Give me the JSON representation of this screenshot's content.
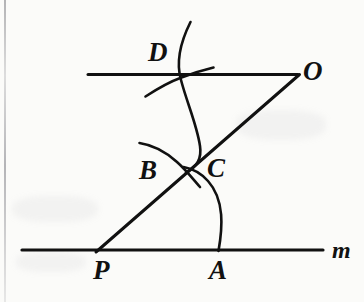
{
  "figure": {
    "type": "geometry-construction-diagram",
    "stroke_color": "#111111",
    "background_color": "#fbfbf9",
    "labels": {
      "D": "D",
      "O": "O",
      "B": "B",
      "C": "C",
      "P": "P",
      "A": "A",
      "m": "m"
    },
    "points": {
      "P": {
        "x": 98,
        "y": 250
      },
      "A": {
        "x": 218,
        "y": 250
      },
      "B": {
        "x": 185,
        "y": 172
      },
      "C": {
        "x": 185,
        "y": 172
      },
      "D": {
        "x": 181,
        "y": 75
      },
      "O": {
        "x": 298,
        "y": 75
      }
    },
    "label_positions": {
      "D": {
        "x": 148,
        "y": 39
      },
      "O": {
        "x": 303,
        "y": 58
      },
      "B": {
        "x": 139,
        "y": 157
      },
      "C": {
        "x": 207,
        "y": 155
      },
      "P": {
        "x": 93,
        "y": 257
      },
      "A": {
        "x": 209,
        "y": 257
      },
      "m": {
        "x": 332,
        "y": 238
      }
    },
    "segments": [
      {
        "name": "line-m",
        "x1": 22,
        "y1": 250,
        "x2": 323,
        "y2": 250
      },
      {
        "name": "line-through-O",
        "x1": 88,
        "y1": 74,
        "x2": 298,
        "y2": 74
      },
      {
        "name": "transversal-PO",
        "x1": 96,
        "y1": 252,
        "x2": 299,
        "y2": 75
      }
    ],
    "arcs": [
      {
        "name": "arc-at-P",
        "from": "A",
        "through": "C",
        "x1": 218,
        "y1": 250,
        "cx": 225,
        "cy": 185,
        "x2": 185,
        "y2": 170
      },
      {
        "name": "arc-at-O",
        "from": "D",
        "through": "below-D",
        "x1": 190,
        "y1": 22,
        "cx": 200,
        "cy": 110,
        "x2": 185,
        "y2": 171
      },
      {
        "name": "arc-short-B",
        "x1": 140,
        "y1": 143,
        "cx": 168,
        "cy": 150,
        "x2": 199,
        "y2": 185
      },
      {
        "name": "arc-short-D",
        "x1": 146,
        "y1": 96,
        "cx": 178,
        "cy": 82,
        "x2": 213,
        "y2": 67
      }
    ]
  }
}
